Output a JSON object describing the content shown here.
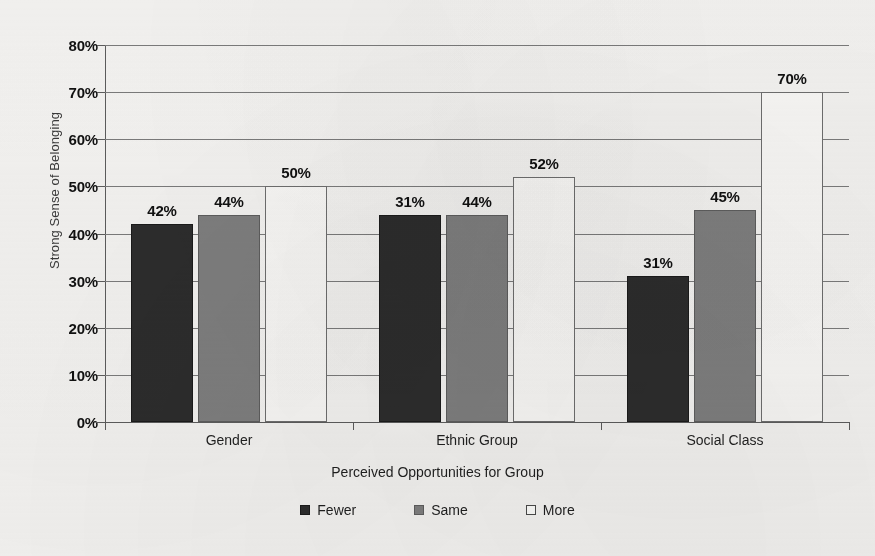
{
  "chart_data": {
    "type": "bar",
    "title": "",
    "xlabel": "Perceived Opportunities for Group",
    "ylabel": "Strong Sense of Belonging",
    "categories": [
      "Gender",
      "Ethnic Group",
      "Social Class"
    ],
    "series": [
      {
        "name": "Fewer",
        "color": "#2d2d2d",
        "values": [
          42,
          44,
          31
        ]
      },
      {
        "name": "Same",
        "color": "#808080",
        "values": [
          44,
          44,
          45
        ]
      },
      {
        "name": "More",
        "color": "#ffffff",
        "values": [
          50,
          52,
          70
        ]
      }
    ],
    "value_labels": [
      [
        "42%",
        "44%",
        "50%"
      ],
      [
        "31%",
        "44%",
        "52%"
      ],
      [
        "31%",
        "45%",
        "70%"
      ]
    ],
    "ylim": [
      0,
      80
    ],
    "ytick_values": [
      80,
      70,
      60,
      50,
      40,
      30,
      20,
      10,
      0
    ],
    "ytick_labels": [
      "80%",
      "70%",
      "60%",
      "50%",
      "40%",
      "30%",
      "20%",
      "10%",
      "0%"
    ],
    "grid": true,
    "legend_position": "bottom"
  },
  "axes": {
    "y_title": "Strong Sense of Belonging",
    "x_title": "Perceived Opportunities for Group"
  },
  "legend": {
    "items": [
      {
        "label": "Fewer"
      },
      {
        "label": "Same"
      },
      {
        "label": "More"
      }
    ]
  }
}
